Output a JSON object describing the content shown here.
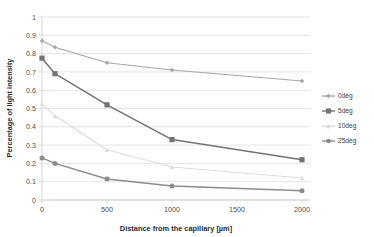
{
  "chart_data": {
    "type": "line",
    "title": "",
    "xlabel": "Distance from the capillary [µm]",
    "ylabel": "Percentage of light intensity",
    "x": [
      0,
      100,
      500,
      1000,
      2000
    ],
    "xlim": [
      0,
      2000
    ],
    "ylim": [
      0,
      1
    ],
    "xticks": [
      "0",
      "500",
      "1000",
      "1500",
      "2000"
    ],
    "xtick_values": [
      0,
      500,
      1000,
      1500,
      2000
    ],
    "yticks": [
      "0",
      "0.1",
      "0.2",
      "0.3",
      "0.4",
      "0.5",
      "0.6",
      "0.7",
      "0.8",
      "0.9",
      "1"
    ],
    "ytick_values": [
      0,
      0.1,
      0.2,
      0.3,
      0.4,
      0.5,
      0.6,
      0.7,
      0.8,
      0.9,
      1
    ],
    "grid": true,
    "legend_position": "right",
    "series": [
      {
        "name": "0deg",
        "values": [
          0.87,
          0.835,
          0.75,
          0.71,
          0.65
        ],
        "color": "#a6a6a6",
        "marker": "diamond"
      },
      {
        "name": "5deg",
        "values": [
          0.775,
          0.69,
          0.52,
          0.33,
          0.22
        ],
        "color": "#737373",
        "marker": "square"
      },
      {
        "name": "10deg",
        "values": [
          0.525,
          0.46,
          0.275,
          0.18,
          0.12
        ],
        "color": "#dcdcdc",
        "marker": "triangle"
      },
      {
        "name": "25deg",
        "values": [
          0.23,
          0.2,
          0.115,
          0.077,
          0.05
        ],
        "color": "#8c8c8c",
        "marker": "circle"
      }
    ]
  },
  "legend": {
    "items": [
      {
        "label": "0deg"
      },
      {
        "label": "5deg"
      },
      {
        "label": "10deg"
      },
      {
        "label": "25deg"
      }
    ]
  },
  "axes": {
    "x_title": "Distance from the capillary [µm]",
    "y_title": "Percentage of light intensity"
  }
}
